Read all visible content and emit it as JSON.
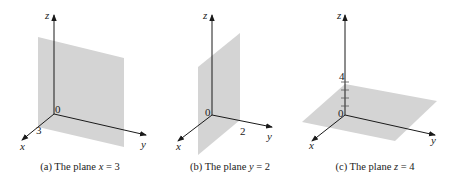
{
  "figure": {
    "panels": [
      {
        "id": "a",
        "caption_prefix": "(a) The plane ",
        "caption_var": "x",
        "caption_suffix": " = 3",
        "origin_label": "0",
        "axis_labels": {
          "x": "x",
          "y": "y",
          "z": "z"
        },
        "marked_value": "3",
        "plane": "x = 3"
      },
      {
        "id": "b",
        "caption_prefix": "(b) The plane ",
        "caption_var": "y",
        "caption_suffix": " = 2",
        "origin_label": "0",
        "axis_labels": {
          "x": "x",
          "y": "y",
          "z": "z"
        },
        "marked_value": "2",
        "plane": "y = 2"
      },
      {
        "id": "c",
        "caption_prefix": "(c) The plane ",
        "caption_var": "z",
        "caption_suffix": " = 4",
        "origin_label": "0",
        "axis_labels": {
          "x": "x",
          "y": "y",
          "z": "z"
        },
        "marked_value": "4",
        "plane": "z = 4"
      }
    ],
    "colors": {
      "plane": "#d4d4d4",
      "axis": "#1a1a1a"
    }
  }
}
